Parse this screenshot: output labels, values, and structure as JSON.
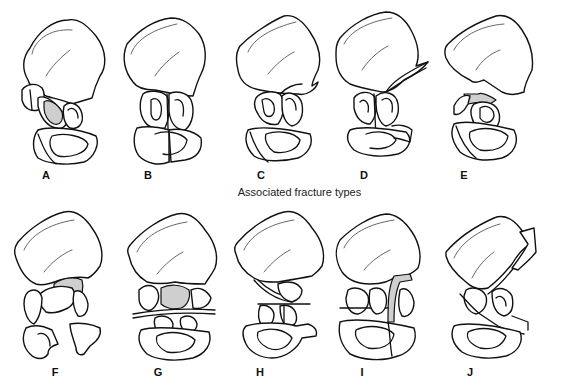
{
  "diagram": {
    "top_heading_cropped": "",
    "section_heading": "Associated fracture types",
    "shade_color": "#cfcfcf",
    "line_color": "#111111",
    "rows": [
      {
        "row": "top",
        "figures": [
          {
            "label": "A",
            "shaded": true
          },
          {
            "label": "B",
            "shaded": false
          },
          {
            "label": "C",
            "shaded": false
          },
          {
            "label": "D",
            "shaded": false
          },
          {
            "label": "E",
            "shaded": true
          }
        ]
      },
      {
        "row": "bottom",
        "figures": [
          {
            "label": "F",
            "shaded": true
          },
          {
            "label": "G",
            "shaded": true
          },
          {
            "label": "H",
            "shaded": false
          },
          {
            "label": "I",
            "shaded": true
          },
          {
            "label": "J",
            "shaded": false
          }
        ]
      }
    ]
  }
}
